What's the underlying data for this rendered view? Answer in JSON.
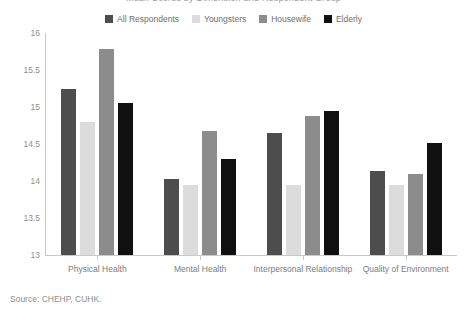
{
  "title_clipped": "Mean Scores by Dimension and Respondent Group",
  "source_note": "Source: CHEHP, CUHK.",
  "legend": {
    "items": [
      {
        "label": "All Respondents",
        "color": "#4d4d4d"
      },
      {
        "label": "Youngsters",
        "color": "#dcdcdc"
      },
      {
        "label": "Housewife",
        "color": "#8c8c8c"
      },
      {
        "label": "Elderly",
        "color": "#101010"
      }
    ]
  },
  "chart_data": {
    "type": "bar",
    "title": "",
    "xlabel": "",
    "ylabel": "",
    "ylim": [
      13,
      16
    ],
    "yticks": [
      16,
      15.5,
      15,
      14.5,
      14,
      13.5,
      13
    ],
    "ytick_labels": [
      "16",
      "15.5",
      "15",
      "14.5",
      "14",
      "13.5",
      "13"
    ],
    "grid": false,
    "legend_position": "top-center",
    "categories": [
      "Physical Health",
      "Mental Health",
      "Interpersonal Relationship",
      "Quality of Environment"
    ],
    "series": [
      {
        "name": "All Respondents",
        "color": "#4d4d4d",
        "values": [
          15.25,
          14.03,
          14.65,
          14.13
        ]
      },
      {
        "name": "Youngsters",
        "color": "#dcdcdc",
        "values": [
          14.8,
          13.95,
          13.95,
          13.95
        ]
      },
      {
        "name": "Housewife",
        "color": "#8c8c8c",
        "values": [
          15.78,
          14.68,
          14.88,
          14.1
        ]
      },
      {
        "name": "Elderly",
        "color": "#101010",
        "values": [
          15.05,
          14.3,
          14.95,
          14.52
        ]
      }
    ]
  }
}
